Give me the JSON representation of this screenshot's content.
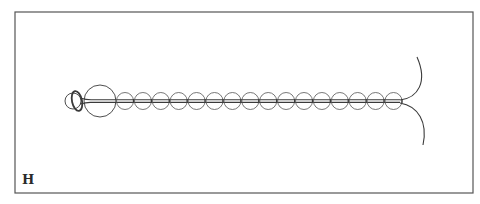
{
  "figure": {
    "panel_label": "H",
    "colors": {
      "stroke": "#3a3a3a",
      "frame": "#555555",
      "background": "#ffffff"
    },
    "frame": {
      "x": 15,
      "y": 12,
      "width": 458,
      "height": 181
    },
    "cord": {
      "y": 101,
      "x_start": 84,
      "x_end": 400
    },
    "head": {
      "small_circle": {
        "cx": 73,
        "cy": 101,
        "r": 8
      },
      "loop_ring": {
        "cx": 77,
        "cy": 101,
        "rx": 5,
        "ry": 10
      },
      "large_bead": {
        "cx": 100,
        "cy": 101,
        "r": 16
      }
    },
    "beads": {
      "count": 16,
      "first_cx": 125,
      "spacing": 17.9,
      "cy": 101,
      "r": 8.5
    },
    "tails": [
      {
        "name": "upper",
        "path": "M400 100 C 418 98, 428 82, 417 57"
      },
      {
        "name": "lower",
        "path": "M400 103 C 418 106, 428 122, 423 145"
      }
    ]
  }
}
